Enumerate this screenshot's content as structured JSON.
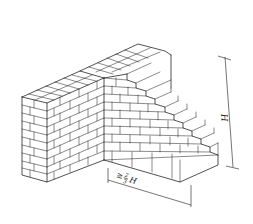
{
  "figure": {
    "background_color": "#ffffff",
    "line_color": "#1a1a1a"
  },
  "dimensions": {
    "height_label": "H",
    "length_label_ge": "≥",
    "length_label_fraction_num": "2",
    "length_label_fraction_den": "3",
    "length_label_var": "H"
  }
}
